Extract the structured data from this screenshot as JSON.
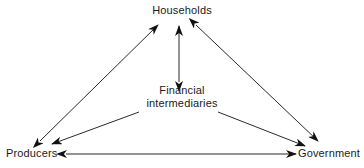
{
  "diagram": {
    "type": "node-link",
    "stroke_color": "#111111",
    "background_color": "#ffffff",
    "nodes": [
      {
        "id": "households",
        "label": "Households",
        "position": "top-center"
      },
      {
        "id": "financial",
        "label_line1": "Financial",
        "label_line2": "intermediaries",
        "position": "center"
      },
      {
        "id": "producers",
        "label": "Producers",
        "position": "bottom-left"
      },
      {
        "id": "government",
        "label": "Government",
        "position": "bottom-right"
      }
    ],
    "edges": [
      {
        "id": "producers-households",
        "from": "Producers",
        "to": "Households",
        "arrows": "both"
      },
      {
        "id": "households-government",
        "from": "Households",
        "to": "Government",
        "arrows": "both"
      },
      {
        "id": "producers-government",
        "from": "Producers",
        "to": "Government",
        "arrows": "both"
      },
      {
        "id": "financial-households",
        "from": "Financial intermediaries",
        "to": "Households",
        "arrows": "both"
      },
      {
        "id": "financial-producers",
        "from": "Financial intermediaries",
        "to": "Producers",
        "arrows": "end"
      },
      {
        "id": "financial-government",
        "from": "Financial intermediaries",
        "to": "Government",
        "arrows": "end"
      }
    ]
  }
}
